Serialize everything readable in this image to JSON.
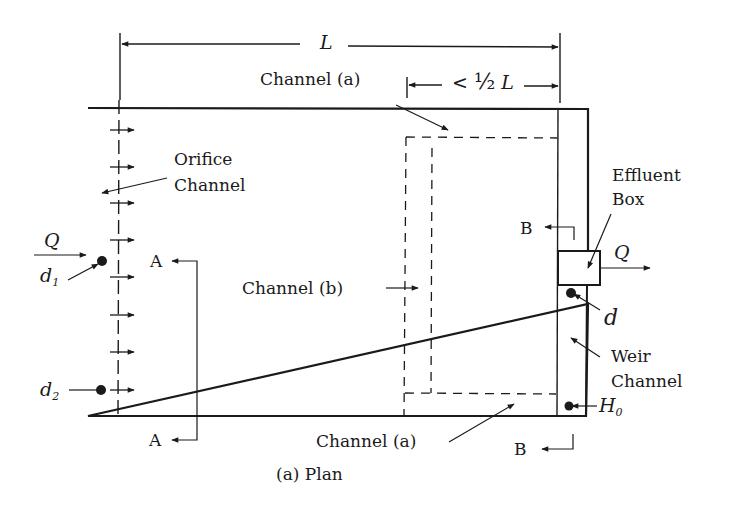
{
  "figure": {
    "caption": "(a)  Plan",
    "dimensions": {
      "total_length": "L",
      "sub_length": "< ½ L",
      "sub_length_prefix": "<",
      "sub_length_fraction": "½",
      "sub_length_var": "L"
    },
    "labels": {
      "channel_a_top": "Channel (a)",
      "channel_a_bottom": "Channel (a)",
      "channel_b": "Channel (b)",
      "orifice_line1": "Orifice",
      "orifice_line2": "Channel",
      "effluent_line1": "Effluent",
      "effluent_line2": "Box",
      "weir_line1": "Weir",
      "weir_line2": "Channel",
      "inflow": "Q",
      "outflow": "Q",
      "d1_base": "d",
      "d1_sub": "1",
      "d2_base": "d",
      "d2_sub": "2",
      "d": "d",
      "h0_base": "H",
      "h0_sub": "0",
      "section_a_top": "A",
      "section_a_bottom": "A",
      "section_b_top": "B",
      "section_b_bottom": "B"
    },
    "colors": {
      "line": "#1a1a1a",
      "background": "#ffffff"
    }
  }
}
